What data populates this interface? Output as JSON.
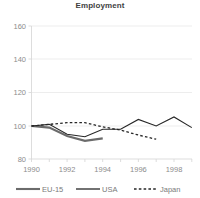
{
  "chart_data": {
    "type": "line",
    "title": "Employment",
    "xlabel": "",
    "ylabel": "",
    "xlim": [
      1990,
      1999
    ],
    "ylim": [
      80,
      160
    ],
    "yticks": [
      80,
      100,
      120,
      140,
      160
    ],
    "xticks": [
      1990,
      1992,
      1994,
      1996,
      1998
    ],
    "xtick_labels": [
      "1990",
      "1992",
      "1994",
      "1996",
      "1998"
    ],
    "ytick_labels": [
      "80",
      "100",
      "120",
      "140",
      "160"
    ],
    "minor_xticks": [
      1991,
      1993,
      1995,
      1997,
      1999
    ],
    "grid": "horizontal",
    "legend_position": "bottom",
    "series": [
      {
        "name": "EU-15",
        "style": "solid-thick",
        "color": "#6b6b6b",
        "x": [
          1990,
          1991,
          1992,
          1993,
          1994
        ],
        "values": [
          100.0,
          99.0,
          94.0,
          91.0,
          92.5
        ]
      },
      {
        "name": "USA",
        "style": "solid-thin",
        "color": "#262626",
        "x": [
          1990,
          1991,
          1992,
          1993,
          1994,
          1995,
          1996,
          1997,
          1998,
          1999
        ],
        "values": [
          100.0,
          101.0,
          95.0,
          93.5,
          98.0,
          98.0,
          104.0,
          100.0,
          105.5,
          99.0
        ]
      },
      {
        "name": "Japan",
        "style": "dashed",
        "color": "#262626",
        "x": [
          1990,
          1991,
          1992,
          1993,
          1994,
          1995,
          1996,
          1997
        ],
        "values": [
          100.0,
          101.0,
          102.0,
          102.0,
          99.5,
          97.5,
          94.5,
          92.0
        ]
      }
    ]
  },
  "legend": {
    "items": [
      {
        "label": "EU-15",
        "swatch": "line-thick-gray"
      },
      {
        "label": "USA",
        "swatch": "line-thin-black"
      },
      {
        "label": "Japan",
        "swatch": "line-dashed-black"
      }
    ]
  },
  "axis": {
    "y_labels": [
      "160",
      "140",
      "120",
      "100",
      "80"
    ],
    "x_labels": [
      "1990",
      "1992",
      "1994",
      "1996",
      "1998"
    ]
  }
}
